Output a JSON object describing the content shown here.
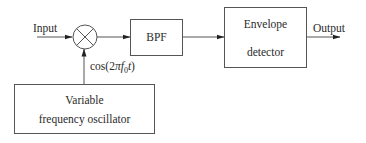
{
  "diagram": {
    "type": "block-diagram",
    "title": "",
    "colors": {
      "stroke": "#555555",
      "text": "#2a2a2a",
      "background": "#ffffff"
    },
    "input_label": "Input",
    "output_label": "Output",
    "mixer": {
      "symbol": "multiplier",
      "glyph": "×"
    },
    "oscillator_signal": {
      "prefix": "cos(2",
      "pi": "π",
      "f": "f",
      "sub": "0",
      "t": "t",
      "suffix": ")",
      "full": "cos(2πf0t)"
    },
    "blocks": [
      {
        "id": "bpf",
        "label": "BPF"
      },
      {
        "id": "envelope",
        "label_line1": "Envelope",
        "label_line2": "detector"
      },
      {
        "id": "vfo",
        "label_line1": "Variable",
        "label_line2": "frequency oscillator"
      }
    ],
    "connections": [
      {
        "from": "Input",
        "to": "mixer"
      },
      {
        "from": "mixer",
        "to": "BPF"
      },
      {
        "from": "BPF",
        "to": "Envelope detector"
      },
      {
        "from": "Envelope detector",
        "to": "Output"
      },
      {
        "from": "Variable frequency oscillator",
        "to": "mixer",
        "label": "cos(2πf0t)"
      }
    ]
  }
}
